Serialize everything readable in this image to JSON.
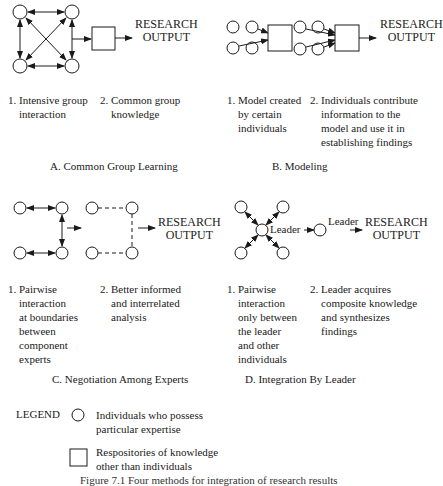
{
  "panels": {
    "A": {
      "caption": "A. Common Group Learning",
      "output_line1": "RESEARCH",
      "output_line2": "OUTPUT",
      "steps": [
        {
          "num": "1.",
          "lines": [
            "Intensive group",
            "interaction"
          ]
        },
        {
          "num": "2.",
          "lines": [
            "Common group",
            "knowledge"
          ]
        }
      ]
    },
    "B": {
      "caption": "B. Modeling",
      "output_line1": "RESEARCH",
      "output_line2": "OUTPUT",
      "steps": [
        {
          "num": "1.",
          "lines": [
            "Model created",
            "by certain",
            "individuals"
          ]
        },
        {
          "num": "2.",
          "lines": [
            "Individuals contribute",
            "information to the",
            "model and  use it in",
            "establishing findings"
          ]
        }
      ]
    },
    "C": {
      "caption": "C. Negotiation Among Experts",
      "output_line1": "RESEARCH",
      "output_line2": "OUTPUT",
      "steps": [
        {
          "num": "1.",
          "lines": [
            "Pairwise",
            "interaction",
            "at boundaries",
            "between",
            "component",
            "experts"
          ]
        },
        {
          "num": "2.",
          "lines": [
            "Better informed",
            "and interrelated",
            "analysis"
          ]
        }
      ]
    },
    "D": {
      "caption": "D. Integration By Leader",
      "leader_label_1": "Leader",
      "leader_label_2": "Leader",
      "output_line1": "RESEARCH",
      "output_line2": "OUTPUT",
      "steps": [
        {
          "num": "1.",
          "lines": [
            "Pairwise",
            "interaction",
            "only between",
            "the leader",
            "and other",
            "individuals"
          ]
        },
        {
          "num": "2.",
          "lines": [
            "Leader acquires",
            "composite knowledge",
            "and synthesizes",
            "findings"
          ]
        }
      ]
    }
  },
  "legend": {
    "title": "LEGEND",
    "circle_line1": "Individuals who possess",
    "circle_line2": "particular expertise",
    "square_line1": "Respositories of knowledge",
    "square_line2": "other than individuals"
  },
  "figure_caption": "Figure 7.1   Four methods for integration of research results"
}
